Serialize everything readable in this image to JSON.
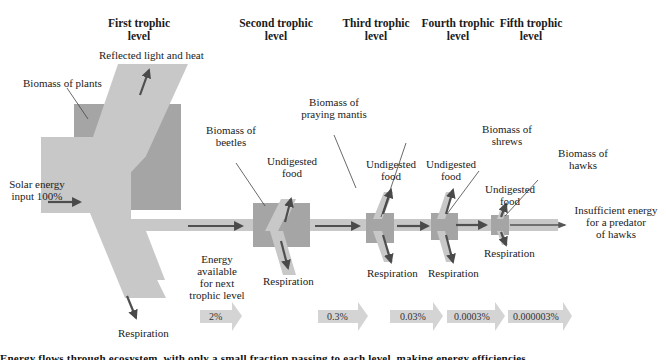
{
  "headers": {
    "first": [
      "First trophic",
      "level"
    ],
    "second": [
      "Second trophic",
      "level"
    ],
    "third": [
      "Third trophic",
      "level"
    ],
    "fourth": [
      "Fourth trophic",
      "level"
    ],
    "fifth": [
      "Fifth trophic",
      "level"
    ]
  },
  "labels": {
    "reflected": "Reflected light and heat",
    "biomass_plants": "Biomass of plants",
    "solar_input": [
      "Solar energy",
      "input 100%"
    ],
    "biomass_beetles": [
      "Biomass of",
      "beetles"
    ],
    "biomass_mantis": [
      "Biomass of",
      "praying mantis"
    ],
    "biomass_shrews": [
      "Biomass of",
      "shrews"
    ],
    "biomass_hawks": [
      "Biomass of",
      "hawks"
    ],
    "undigested": [
      "Undigested",
      "food"
    ],
    "respiration": "Respiration",
    "energy_available": [
      "Energy",
      "available",
      "for next",
      "trophic level"
    ],
    "insufficient": [
      "Insufficient energy",
      "for a predator",
      "of hawks"
    ]
  },
  "energy_percentages": [
    "2%",
    "0.3%",
    "0.03%",
    "0.0003%",
    "0.000003%"
  ],
  "caption_partial": "Energy flows through ecosystem, with only a small fraction passing to each level, making energy efficiencies",
  "colors": {
    "flow": "#c9c9c9",
    "biomass": "#a7a7a7",
    "arrow": "#4a4a4a",
    "pct_arrow": "#d4d4d4"
  }
}
